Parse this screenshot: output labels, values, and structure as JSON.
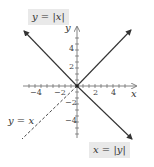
{
  "labels": {
    "y_abs_x": "y = |x|",
    "x_abs_y": "x = |y|",
    "y_eq_x": "y = x",
    "x_axis": "x",
    "y_axis": "y"
  },
  "ticks": {
    "x": [
      "−4",
      "−2",
      "2",
      "4"
    ],
    "y": [
      "4",
      "2",
      "−2",
      "−4"
    ]
  },
  "colors": {
    "line": "#333333",
    "label_box": "#e9e9e9",
    "axis": "#666666"
  }
}
